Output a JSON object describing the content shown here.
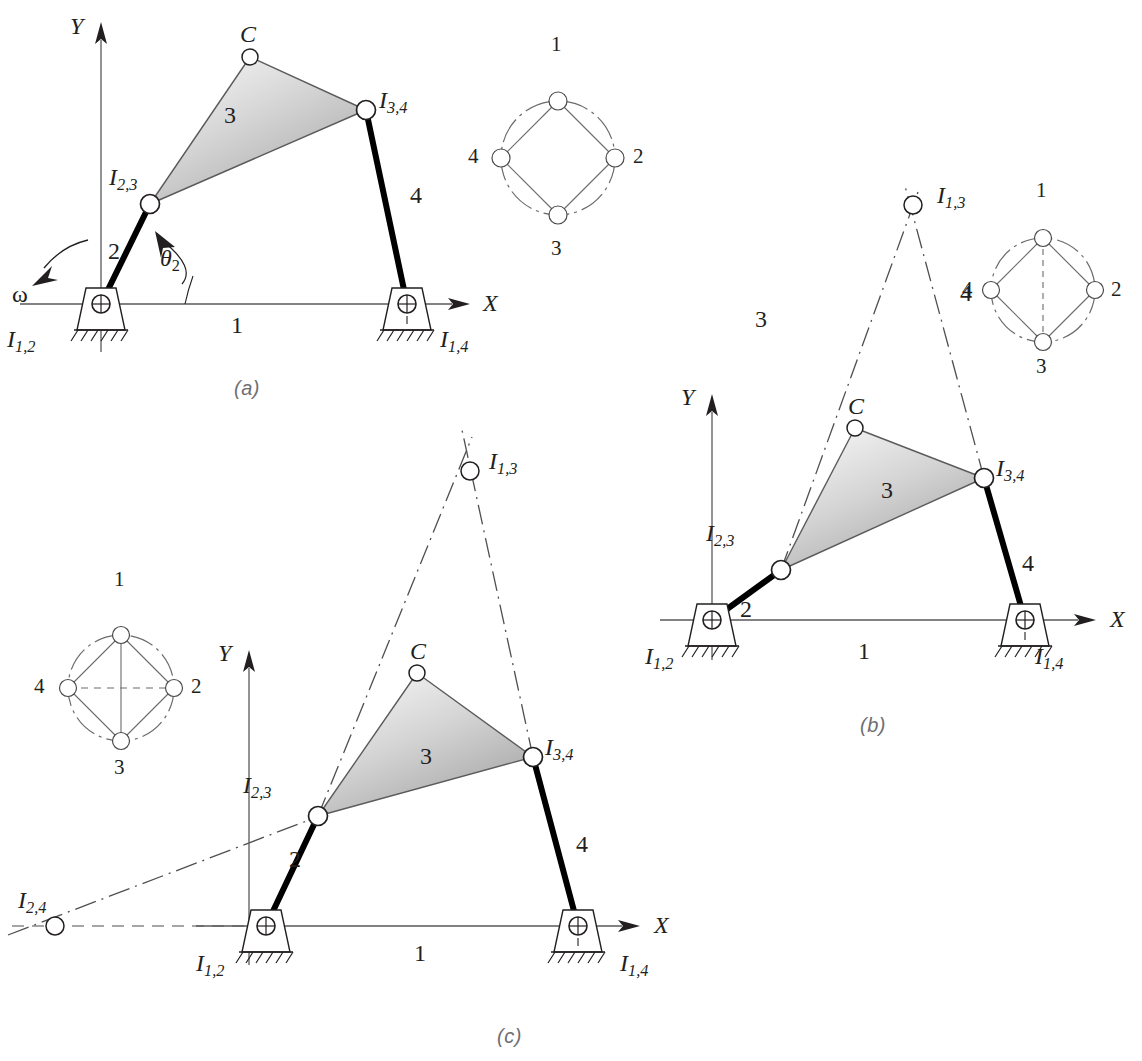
{
  "figure": {
    "panels": [
      {
        "id": "a",
        "tag": "(a)"
      },
      {
        "id": "b",
        "tag": "(b)"
      },
      {
        "id": "c",
        "tag": "(c)"
      }
    ]
  },
  "colors": {
    "ink": "#231f20",
    "panel_tag": "#6e6e72",
    "link_black": "#000000",
    "thin_line": "#58595b",
    "coupler_fill_light": "#f2f2f2",
    "coupler_fill_dark": "#b9b9b9",
    "joint_fill": "#ffffff"
  },
  "panel_a": {
    "tag": "(a)",
    "axis_y": "Y",
    "axis_x": "X",
    "point_c": "C",
    "link2": "2",
    "link3": "3",
    "link4": "4",
    "ground": "1",
    "omega": "ω",
    "theta": {
      "sym": "θ",
      "sub": "2"
    },
    "ic_12": {
      "sym": "I",
      "sub": "1,2"
    },
    "ic_23": {
      "sym": "I",
      "sub": "2,3"
    },
    "ic_34": {
      "sym": "I",
      "sub": "3,4"
    },
    "ic_14": {
      "sym": "I",
      "sub": "1,4"
    },
    "circle_diagram": {
      "nodes": [
        "1",
        "2",
        "3",
        "4"
      ],
      "node_positions": {
        "1": "top",
        "2": "right",
        "3": "bottom",
        "4": "left"
      },
      "edges": [
        [
          "1",
          "2"
        ],
        [
          "2",
          "3"
        ],
        [
          "3",
          "4"
        ],
        [
          "4",
          "1"
        ]
      ],
      "diagonals": []
    }
  },
  "panel_b": {
    "tag": "(b)",
    "axis_y": "Y",
    "axis_x": "X",
    "point_c": "C",
    "link2": "2",
    "link3": "3",
    "link4": "4",
    "ground": "1",
    "label_3_outer": "3",
    "label_4_outer": "4",
    "ic_12": {
      "sym": "I",
      "sub": "1,2"
    },
    "ic_23": {
      "sym": "I",
      "sub": "2,3"
    },
    "ic_34": {
      "sym": "I",
      "sub": "3,4"
    },
    "ic_14": {
      "sym": "I",
      "sub": "1,4"
    },
    "ic_13": {
      "sym": "I",
      "sub": "1,3"
    },
    "circle_diagram": {
      "nodes": [
        "1",
        "2",
        "3",
        "4"
      ],
      "node_positions": {
        "1": "top",
        "2": "right",
        "3": "bottom",
        "4": "left"
      },
      "edges": [
        [
          "1",
          "2"
        ],
        [
          "2",
          "3"
        ],
        [
          "3",
          "4"
        ],
        [
          "4",
          "1"
        ]
      ],
      "diagonals": [
        {
          "pair": [
            "1",
            "3"
          ],
          "style": "dashed"
        }
      ]
    }
  },
  "panel_c": {
    "tag": "(c)",
    "axis_y": "Y",
    "axis_x": "X",
    "point_c": "C",
    "link2": "2",
    "link3": "3",
    "link4": "4",
    "ground": "1",
    "ic_12": {
      "sym": "I",
      "sub": "1,2"
    },
    "ic_23": {
      "sym": "I",
      "sub": "2,3"
    },
    "ic_34": {
      "sym": "I",
      "sub": "3,4"
    },
    "ic_14": {
      "sym": "I",
      "sub": "1,4"
    },
    "ic_13": {
      "sym": "I",
      "sub": "1,3"
    },
    "ic_24": {
      "sym": "I",
      "sub": "2,4"
    },
    "circle_diagram": {
      "nodes": [
        "1",
        "2",
        "3",
        "4"
      ],
      "node_positions": {
        "1": "top",
        "2": "right",
        "3": "bottom",
        "4": "left"
      },
      "edges": [
        [
          "1",
          "2"
        ],
        [
          "2",
          "3"
        ],
        [
          "3",
          "4"
        ],
        [
          "4",
          "1"
        ]
      ],
      "diagonals": [
        {
          "pair": [
            "1",
            "3"
          ],
          "style": "solid"
        },
        {
          "pair": [
            "4",
            "2"
          ],
          "style": "dashed"
        }
      ]
    }
  }
}
